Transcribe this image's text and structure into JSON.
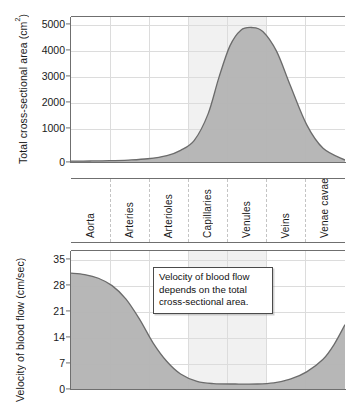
{
  "figure": {
    "name": "blood-flow-figure",
    "colors": {
      "area_fill": "#b3b3b3",
      "area_stroke": "#6b6b6b",
      "grid": "#dcdcdc",
      "axis": "#6f6f6f",
      "background": "#ffffff"
    }
  },
  "categories": [
    "Aorta",
    "Arteries",
    "Arterioles",
    "Capillaries",
    "Venules",
    "Veins",
    "Venae cavae"
  ],
  "annotation": {
    "line1": "Velocity of blood flow",
    "line2": "depends on the total",
    "line3": "cross-sectional area."
  },
  "chart_data": [
    {
      "type": "area",
      "id": "cross-sectional-area",
      "title": "",
      "xlabel": "",
      "ylabel": "Total cross-sectional area (cm",
      "ylabel_sup": "2",
      "ylabel_suffix": ")",
      "categories": [
        "Aorta",
        "Arteries",
        "Arterioles",
        "Capillaries",
        "Venules",
        "Veins",
        "Venae cavae"
      ],
      "yticks": [
        0,
        1000,
        2000,
        3000,
        4000,
        5000
      ],
      "ytick_labels": [
        "0",
        "1000",
        "2000",
        "3000",
        "4000",
        "5000"
      ],
      "ylim": [
        0,
        5600
      ],
      "grid": true,
      "legend": "none",
      "values": [
        100,
        180,
        700,
        5200,
        2600,
        500,
        120
      ],
      "sampled_x": [
        0.0,
        0.07,
        0.14,
        0.21,
        0.28,
        0.35,
        0.4,
        0.45,
        0.5,
        0.54,
        0.58,
        0.62,
        0.66,
        0.7,
        0.75,
        0.8,
        0.86,
        0.92,
        1.0
      ],
      "sampled_y": [
        110,
        115,
        125,
        150,
        200,
        320,
        520,
        900,
        1900,
        3300,
        4500,
        5100,
        5200,
        5050,
        4300,
        3000,
        1500,
        600,
        150
      ]
    },
    {
      "type": "area",
      "id": "velocity-of-blood-flow",
      "title": "",
      "xlabel": "",
      "ylabel": "Velocity of blood flow (cm/sec)",
      "categories": [
        "Aorta",
        "Arteries",
        "Arterioles",
        "Capillaries",
        "Venules",
        "Veins",
        "Venae cavae"
      ],
      "yticks": [
        0,
        7,
        14,
        21,
        28,
        35
      ],
      "ytick_labels": [
        "0",
        "7",
        "14",
        "21",
        "28",
        "35"
      ],
      "ylim": [
        0,
        38
      ],
      "grid": true,
      "legend": "none",
      "values": [
        32,
        25,
        6,
        1.5,
        1.5,
        4,
        18
      ],
      "sampled_x": [
        0.0,
        0.05,
        0.1,
        0.15,
        0.2,
        0.25,
        0.3,
        0.35,
        0.4,
        0.46,
        0.52,
        0.6,
        0.68,
        0.74,
        0.8,
        0.86,
        0.92,
        0.96,
        1.0
      ],
      "sampled_y": [
        32.0,
        31.6,
        30.6,
        28.6,
        25.0,
        19.5,
        13.0,
        8.0,
        4.6,
        2.6,
        2.0,
        1.9,
        1.9,
        2.2,
        3.2,
        5.2,
        8.6,
        12.6,
        18.0
      ]
    }
  ]
}
